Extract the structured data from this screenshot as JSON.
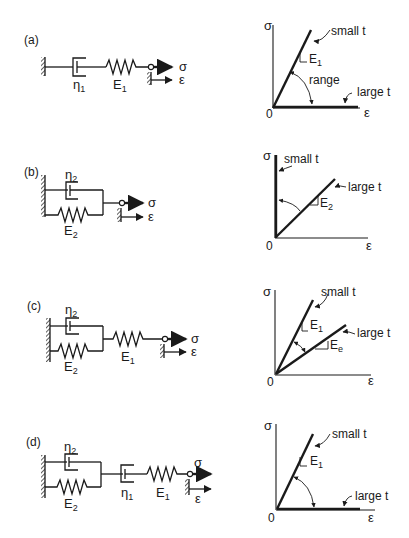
{
  "panels": [
    {
      "id": "a",
      "label": "(a)",
      "model": {
        "dashpot1": "η",
        "dashpot1_sub": "1",
        "spring1": "E",
        "spring1_sub": "1",
        "stress": "σ",
        "strain": "ε"
      },
      "graph": {
        "y_axis": "σ",
        "x_axis": "ε",
        "origin": "0",
        "curve_top": "small t",
        "curve_bottom": "large t",
        "slope": "E",
        "slope_sub": "1",
        "range": "range"
      }
    },
    {
      "id": "b",
      "label": "(b)",
      "model": {
        "dashpot2": "η",
        "dashpot2_sub": "2",
        "spring2": "E",
        "spring2_sub": "2",
        "stress": "σ",
        "strain": "ε"
      },
      "graph": {
        "y_axis": "σ",
        "x_axis": "ε",
        "origin": "0",
        "curve_top": "small t",
        "curve_bottom": "large t",
        "slope": "E",
        "slope_sub": "2"
      }
    },
    {
      "id": "c",
      "label": "(c)",
      "model": {
        "dashpot2": "η",
        "dashpot2_sub": "2",
        "spring2": "E",
        "spring2_sub": "2",
        "spring1": "E",
        "spring1_sub": "1",
        "stress": "σ",
        "strain": "ε"
      },
      "graph": {
        "y_axis": "σ",
        "x_axis": "ε",
        "origin": "0",
        "curve_top": "small t",
        "curve_bottom": "large t",
        "slope_top": "E",
        "slope_top_sub": "1",
        "slope_bottom": "E",
        "slope_bottom_sub": "e"
      }
    },
    {
      "id": "d",
      "label": "(d)",
      "model": {
        "dashpot2": "η",
        "dashpot2_sub": "2",
        "spring2": "E",
        "spring2_sub": "2",
        "dashpot1": "η",
        "dashpot1_sub": "1",
        "spring1": "E",
        "spring1_sub": "1",
        "stress": "σ",
        "strain": "ε"
      },
      "graph": {
        "y_axis": "σ",
        "x_axis": "ε",
        "origin": "0",
        "curve_top": "small t",
        "curve_bottom": "large t",
        "slope": "E",
        "slope_sub": "1"
      }
    }
  ]
}
